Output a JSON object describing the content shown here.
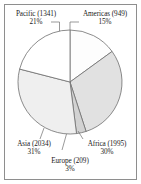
{
  "chart_data": {
    "type": "pie",
    "title": "",
    "subtitle": "",
    "xlabel": "",
    "ylabel": "",
    "legend_position": "none",
    "grid": false,
    "start_angle_deg": 0,
    "direction": "clockwise",
    "total": 6528,
    "units": "count",
    "categories": [
      "Americas",
      "Africa",
      "Europe",
      "Asia",
      "Pacific"
    ],
    "values": [
      949,
      1995,
      209,
      2034,
      1341
    ],
    "percentages": [
      15,
      30,
      3,
      31,
      21
    ],
    "colors": [
      "#fdfdfd",
      "#e1e1e1",
      "#d2d2d2",
      "#efefef",
      "#ffffff"
    ],
    "slices": [
      {
        "name": "Americas",
        "value": 949,
        "percent": 15,
        "label_line1": "Americas (949)",
        "label_line2": "15%",
        "color": "#fdfdfd"
      },
      {
        "name": "Africa",
        "value": 1995,
        "percent": 30,
        "label_line1": "Africa (1995)",
        "label_line2": "30%",
        "color": "#e1e1e1"
      },
      {
        "name": "Europe",
        "value": 209,
        "percent": 3,
        "label_line1": "Europe (209)",
        "label_line2": "3%",
        "color": "#d2d2d2"
      },
      {
        "name": "Asia",
        "value": 2034,
        "percent": 31,
        "label_line1": "Asia (2034)",
        "label_line2": "31%",
        "color": "#efefef"
      },
      {
        "name": "Pacific",
        "value": 1341,
        "percent": 21,
        "label_line1": "Pacific (1341)",
        "label_line2": "21%",
        "color": "#ffffff"
      }
    ]
  },
  "style": {
    "frame_border_color": "#8e8e8e",
    "slice_outline_color": "#6f6f6f",
    "background": "#ffffff",
    "text_color": "#1a1a1a"
  }
}
